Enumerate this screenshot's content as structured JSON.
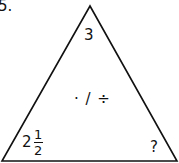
{
  "problem_number": "5.",
  "triangle": {
    "top": "3",
    "center_operations": "· / ÷",
    "bottom_left": {
      "whole": "2",
      "numerator": "1",
      "denominator": "2"
    },
    "bottom_right": "?"
  }
}
